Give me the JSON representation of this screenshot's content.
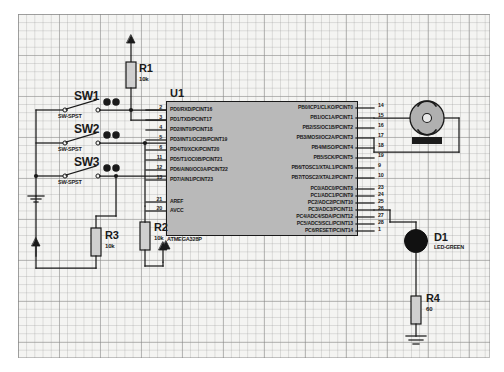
{
  "sheet": {
    "title": "ATmega328P switch input and LED/buzzer output schematic",
    "grid": "on",
    "background_color": "#f4f4f2",
    "wire_color": "#1a1a1a"
  },
  "ic": {
    "reference": "U1",
    "part": "ATMEGA328P",
    "body_color": "#b9b9b9",
    "left_pins": [
      {
        "num": "2",
        "name": "PD0/RXD/PCINT16"
      },
      {
        "num": "3",
        "name": "PD1/TXD/PCINT17"
      },
      {
        "num": "4",
        "name": "PD2/INT0/PCINT18"
      },
      {
        "num": "5",
        "name": "PD3/INT1/OC2B/PCINT19"
      },
      {
        "num": "6",
        "name": "PD4/T0/XCK/PCINT20"
      },
      {
        "num": "11",
        "name": "PD5/T1/OC0B/PCINT21"
      },
      {
        "num": "12",
        "name": "PD6/AIN0/OC0A/PCINT22"
      },
      {
        "num": "13",
        "name": "PD7/AIN1/PCINT23"
      }
    ],
    "left_power_pins": [
      {
        "num": "21",
        "name": "AREF"
      },
      {
        "num": "20",
        "name": "AVCC"
      }
    ],
    "right_portb_pins": [
      {
        "num": "14",
        "name": "PB0/ICP1/CLKO/PCINT0"
      },
      {
        "num": "15",
        "name": "PB1/OC1A/PCINT1"
      },
      {
        "num": "16",
        "name": "PB2/SS/OC1B/PCINT2"
      },
      {
        "num": "17",
        "name": "PB3/MOSI/OC2A/PCINT3"
      },
      {
        "num": "18",
        "name": "PB4/MISO/PCINT4"
      },
      {
        "num": "19",
        "name": "PB5/SCK/PCINT5"
      },
      {
        "num": "9",
        "name": "PB6/TOSC1/XTAL1/PCINT6"
      },
      {
        "num": "10",
        "name": "PB7/TOSC2/XTAL2/PCINT7"
      }
    ],
    "right_portc_pins": [
      {
        "num": "23",
        "name": "PC0/ADC0/PCINT8"
      },
      {
        "num": "24",
        "name": "PC1/ADC1/PCINT9"
      },
      {
        "num": "25",
        "name": "PC2/ADC2/PCINT10"
      },
      {
        "num": "26",
        "name": "PC3/ADC3/PCINT11"
      },
      {
        "num": "27",
        "name": "PC4/ADC4/SDA/PCINT12"
      },
      {
        "num": "28",
        "name": "PC5/ADC5/SCL/PCINT13"
      },
      {
        "num": "1",
        "name": "PC6/RESET/PCINT14"
      }
    ]
  },
  "switches": [
    {
      "reference": "SW1",
      "value": "SW-SPST"
    },
    {
      "reference": "SW2",
      "value": "SW-SPST"
    },
    {
      "reference": "SW3",
      "value": "SW-SPST"
    }
  ],
  "resistors": [
    {
      "reference": "R1",
      "value": "10k"
    },
    {
      "reference": "R2",
      "value": "10k"
    },
    {
      "reference": "R3",
      "value": "10k"
    },
    {
      "reference": "R4",
      "value": "60"
    }
  ],
  "devices": [
    {
      "reference": "D1",
      "value": "LED-GREEN",
      "type": "led"
    },
    {
      "reference": "",
      "value": "",
      "type": "buzzer"
    }
  ],
  "symbols": {
    "power_terminal": "power-triangle",
    "ground_terminal": "ground-bars",
    "junction": "junction-dot"
  }
}
